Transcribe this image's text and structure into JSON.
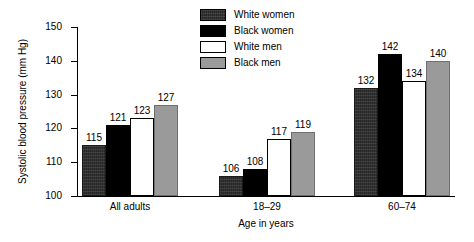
{
  "chart_data": {
    "type": "bar",
    "title": "",
    "subtitle": "",
    "xlabel": "Age in years",
    "ylabel": "Systolic blood pressure (mm Hg)",
    "ylim": [
      100,
      150
    ],
    "yticks": [
      100,
      110,
      120,
      130,
      140,
      150
    ],
    "ytick_labels": [
      "100",
      "110",
      "120",
      "130",
      "140",
      "150"
    ],
    "grid": false,
    "legend_position": "top-center",
    "categories": [
      "All adults",
      "18–29",
      "60–74"
    ],
    "series": [
      {
        "name": "White women",
        "color": "#262626",
        "fill": "dark-speckled",
        "values": [
          115,
          106,
          132
        ],
        "value_labels": [
          "115",
          "106",
          "132"
        ]
      },
      {
        "name": "Black women",
        "color": "#000000",
        "fill": "solid-black",
        "values": [
          121,
          108,
          142
        ],
        "value_labels": [
          "121",
          "108",
          "142"
        ]
      },
      {
        "name": "White men",
        "color": "#ffffff",
        "fill": "white-outline",
        "values": [
          123,
          117,
          134
        ],
        "value_labels": [
          "123",
          "117",
          "134"
        ]
      },
      {
        "name": "Black men",
        "color": "#9a9a9a",
        "fill": "gray",
        "values": [
          127,
          119,
          140
        ],
        "value_labels": [
          "127",
          "119",
          "140"
        ]
      }
    ]
  },
  "figure": {
    "background_color": "#ffffff",
    "axis_color": "#000000",
    "text_color": "#000000"
  }
}
